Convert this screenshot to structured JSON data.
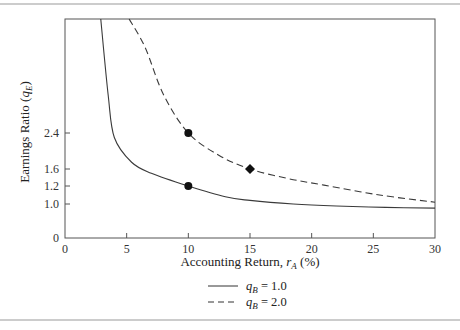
{
  "chart_data": {
    "type": "line",
    "title": "",
    "xlabel": "Accounting Return, r_A (%)",
    "xlabel_main": "Accounting Return, ",
    "xlabel_var": "r",
    "xlabel_sub": "A",
    "xlabel_unit": " (%)",
    "ylabel": "Earnings Ratio (q_E)",
    "ylabel_main": "Earnings Ratio (",
    "ylabel_var": "q",
    "ylabel_sub": "E",
    "ylabel_close": ")",
    "xlim": [
      0,
      30
    ],
    "ylim": [
      0,
      3.0
    ],
    "grid": false,
    "x_ticks": [
      0,
      5,
      10,
      15,
      20,
      25,
      30
    ],
    "x_tick_labels": [
      "0",
      "5",
      "10",
      "15",
      "20",
      "25",
      "30"
    ],
    "y_ticks": [
      0,
      1.0,
      1.2,
      1.6,
      2.4
    ],
    "y_tick_labels": [
      "0",
      "1.0",
      "1.2",
      "1.6",
      "2.4"
    ],
    "legend_position": "bottom-center",
    "series": [
      {
        "name": "q_B = 1.0",
        "legend_var": "q",
        "legend_sub": "B",
        "legend_value": " = 1.0",
        "style": "solid",
        "points": [
          [
            2.9,
            3.0
          ],
          [
            3.5,
            2.6
          ],
          [
            4.0,
            2.3
          ],
          [
            5.4,
            1.75
          ],
          [
            7.0,
            1.5
          ],
          [
            10.0,
            1.2
          ],
          [
            13.0,
            1.08
          ],
          [
            15.0,
            1.04
          ],
          [
            18.5,
            1.0
          ],
          [
            22.0,
            0.94
          ],
          [
            26.0,
            0.9
          ],
          [
            30.0,
            0.88
          ]
        ],
        "markers": [
          {
            "x": 10.0,
            "y": 1.2,
            "shape": "circle"
          }
        ]
      },
      {
        "name": "q_B = 2.0",
        "legend_var": "q",
        "legend_sub": "B",
        "legend_value": " = 2.0",
        "style": "dashed",
        "points": [
          [
            5.2,
            3.0
          ],
          [
            6.5,
            2.85
          ],
          [
            8.0,
            2.6
          ],
          [
            10.0,
            2.4
          ],
          [
            12.5,
            1.9
          ],
          [
            15.0,
            1.6
          ],
          [
            18.0,
            1.38
          ],
          [
            21.0,
            1.22
          ],
          [
            25.5,
            1.1
          ],
          [
            30.0,
            1.02
          ]
        ],
        "markers": [
          {
            "x": 10.0,
            "y": 2.4,
            "shape": "circle"
          },
          {
            "x": 15.0,
            "y": 1.6,
            "shape": "diamond"
          }
        ]
      }
    ]
  }
}
